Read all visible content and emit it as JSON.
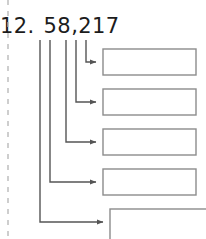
{
  "page": {
    "width": 206,
    "height": 239,
    "background_color": "#ffffff",
    "kind": "place-value-expansion-worksheet-item"
  },
  "problem": {
    "number_label": "12.",
    "value": "58,217",
    "digits": [
      "5",
      "8",
      "2",
      "1",
      "7"
    ],
    "text_color": "#1c1c1c"
  },
  "margin_rule": {
    "name": "dashed-cut-line",
    "orientation": "vertical",
    "x": 8,
    "y_start": 0,
    "y_end": 239,
    "color": "#b4b4b4",
    "dash": "5 6",
    "width": 1.3
  },
  "connectors": {
    "color": "#555555",
    "width": 1.4,
    "arrowhead": "solid-triangle",
    "corner": "square-elbow",
    "leaders": [
      {
        "digit": "5",
        "x": 40,
        "y_top": 40,
        "elbow_y": 222,
        "arrow_x": 110
      },
      {
        "digit": "8",
        "x": 50,
        "y_top": 40,
        "elbow_y": 182,
        "arrow_x": 103
      },
      {
        "digit": "2",
        "x": 66,
        "y_top": 40,
        "elbow_y": 142,
        "arrow_x": 103
      },
      {
        "digit": "1",
        "x": 76,
        "y_top": 40,
        "elbow_y": 102,
        "arrow_x": 103
      },
      {
        "digit": "7",
        "x": 86,
        "y_top": 40,
        "elbow_y": 62,
        "arrow_x": 103
      }
    ]
  },
  "answer_boxes": {
    "count": 5,
    "border_color": "#8c8c8c",
    "fill_color": "#ffffff",
    "border_width": 1.4,
    "value": "",
    "items": [
      {
        "name": "answer-box-1",
        "digit": "7",
        "x": 103,
        "y": 49,
        "width": 93,
        "height": 26,
        "clipped": false
      },
      {
        "name": "answer-box-2",
        "digit": "1",
        "x": 103,
        "y": 89,
        "width": 93,
        "height": 26,
        "clipped": false
      },
      {
        "name": "answer-box-3",
        "digit": "2",
        "x": 103,
        "y": 129,
        "width": 93,
        "height": 26,
        "clipped": false
      },
      {
        "name": "answer-box-4",
        "digit": "8",
        "x": 103,
        "y": 169,
        "width": 93,
        "height": 26,
        "clipped": false
      },
      {
        "name": "answer-box-5",
        "digit": "5",
        "x": 110,
        "y": 209,
        "width": 96,
        "height": 30,
        "clipped": true
      }
    ]
  }
}
